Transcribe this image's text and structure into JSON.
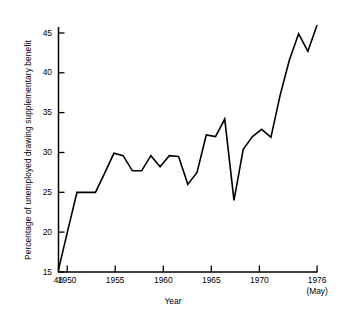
{
  "chart_data": {
    "type": "line",
    "title": "",
    "xlabel": "Year",
    "ylabel": "Percentage of unemployed drawing supplementary benefit",
    "xlim": [
      1948,
      1976.4
    ],
    "ylim": [
      15,
      46.8
    ],
    "grid": false,
    "legend": null,
    "x_tick_labels": [
      "48",
      "1950",
      "1955",
      "1960",
      "1965",
      "1970",
      "1976"
    ],
    "x_tick_values": [
      1948,
      1950,
      1955,
      1960,
      1965,
      1970,
      1976
    ],
    "x_tick_sublabel": "(May)",
    "y_tick_labels": [
      "15",
      "20",
      "25",
      "30",
      "35",
      "40",
      "45"
    ],
    "y_tick_values": [
      15,
      20,
      25,
      30,
      35,
      40,
      45
    ],
    "series": [
      {
        "name": "Percentage of unemployed drawing supplementary benefit",
        "color": "#000000",
        "x": [
          1948,
          1949,
          1950,
          1951,
          1952,
          1953,
          1954,
          1955,
          1956,
          1957,
          1958,
          1959,
          1960,
          1961,
          1962,
          1963,
          1964,
          1965,
          1966,
          1967,
          1968,
          1969,
          1970,
          1971,
          1972,
          1973,
          1974,
          1975,
          1976
        ],
        "y": [
          15.3,
          20.2,
          25.0,
          25.0,
          25.0,
          27.4,
          29.9,
          29.6,
          27.7,
          27.7,
          29.6,
          28.2,
          29.6,
          29.5,
          26.0,
          27.5,
          32.2,
          32.0,
          34.2,
          24.0,
          30.4,
          32.0,
          32.9,
          31.9,
          37.2,
          41.6,
          44.9,
          42.7,
          46.0
        ]
      }
    ]
  },
  "axis_titles": {
    "y": "Percentage of unemployed drawing supplementary benefit",
    "x": "Year"
  }
}
